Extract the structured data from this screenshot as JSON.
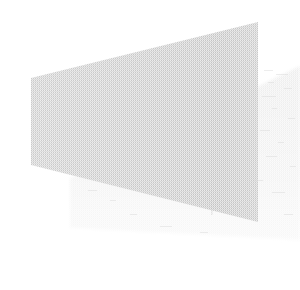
{
  "image": {
    "kind": "scanned-geometric-figure",
    "width": 300,
    "height": 290,
    "background_color": "#ffffff",
    "texture": "dithered-halftone-scan",
    "alt_text": "Faint scanned grayscale trapezoid with a lighter offset drop shadow",
    "visible_text": []
  },
  "shapes": [
    {
      "name": "drop-shadow-quadrilateral",
      "role": "offset shadow behind main panel",
      "fill_color": "#efefef",
      "edge_color": "#e8e8e8",
      "points": "70,178 300,66 300,240 70,228",
      "points_list": [
        {
          "x": 70,
          "y": 178
        },
        {
          "x": 300,
          "y": 66
        },
        {
          "x": 300,
          "y": 240
        },
        {
          "x": 70,
          "y": 228
        }
      ]
    },
    {
      "name": "main-trapezoid-panel",
      "role": "primary gray quadrilateral",
      "fill_color": "#c9c9c9",
      "edge_color": "#bfbfbf",
      "points": "31,78 258,22 258,222 31,165",
      "points_list": [
        {
          "x": 31,
          "y": 78
        },
        {
          "x": 258,
          "y": 22
        },
        {
          "x": 258,
          "y": 222
        },
        {
          "x": 31,
          "y": 165
        }
      ]
    }
  ],
  "vertical_seam": {
    "name": "panel-vertical-crease",
    "description": "faint darker vertical band near the right portion of the main panel",
    "x": 212,
    "y_top": 37,
    "y_bottom": 215,
    "color": "#c0c0c0"
  },
  "palette": {
    "background": "#ffffff",
    "main_fill": "#c9c9c9",
    "shadow_fill": "#efefef",
    "shadow_fill_light": "#f4f4f4",
    "seam": "#c0c0c0"
  }
}
